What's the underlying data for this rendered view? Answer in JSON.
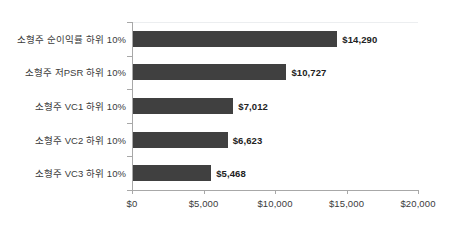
{
  "chart_data": {
    "type": "bar",
    "orientation": "horizontal",
    "title": "",
    "subtitle": "",
    "xlabel": "",
    "ylabel": "",
    "grid": false,
    "legend": false,
    "legend_position": "none",
    "xlim": [
      0,
      20000
    ],
    "x_tick_labels": [
      "$0",
      "$5,000",
      "$10,000",
      "$15,000",
      "$20,000"
    ],
    "x_tick_values": [
      0,
      5000,
      10000,
      15000,
      20000
    ],
    "categories": [
      "소형주 순이익률 하위 10%",
      "소형주 저PSR 하위 10%",
      "소형주 VC1 하위 10%",
      "소형주 VC2 하위 10%",
      "소형주 VC3 하위 10%"
    ],
    "values": [
      14290,
      10727,
      7012,
      6623,
      5468
    ],
    "data_labels": [
      "$14,290",
      "$10,727",
      "$7,012",
      "$6,623",
      "$5,468"
    ],
    "bar_color": "#404040",
    "axis_color": "#a8a8a8",
    "text_color": "#3b3b3b",
    "background_color": "#ffffff"
  }
}
